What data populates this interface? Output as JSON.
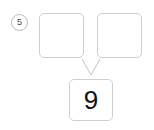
{
  "problem": {
    "number_label": "5",
    "type": "number-bond",
    "accent_color": "#cfcfcf",
    "text_color": "#111111",
    "background_color": "#ffffff"
  },
  "bond": {
    "parts": [
      {
        "name": "left-part",
        "value": "",
        "filled": false
      },
      {
        "name": "right-part",
        "value": "",
        "filled": false
      }
    ],
    "total": {
      "name": "total",
      "value": "9",
      "filled": true
    }
  },
  "connectors": {
    "left_line": {
      "from_x": 82,
      "from_y": 59,
      "to_x": 91,
      "to_y": 75
    },
    "right_line": {
      "from_x": 100,
      "from_y": 59,
      "to_x": 91,
      "to_y": 75
    },
    "stroke_color": "#c4c4c4",
    "stroke_width": 1
  }
}
